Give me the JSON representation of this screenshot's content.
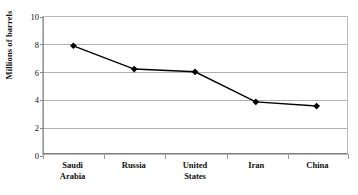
{
  "chart_data": {
    "type": "line",
    "title": "",
    "xlabel": "",
    "ylabel": "Millions of barrels",
    "categories": [
      "Saudi Arabia",
      "Russia",
      "United States",
      "Iran",
      "China"
    ],
    "category_lines": [
      [
        "Saudi",
        "Arabia"
      ],
      [
        "Russia"
      ],
      [
        "United",
        "States"
      ],
      [
        "Iran"
      ],
      [
        "China"
      ]
    ],
    "values": [
      7.9,
      6.2,
      6.0,
      3.8,
      3.5
    ],
    "ylim": [
      0,
      10
    ],
    "ytick_values": [
      0,
      2,
      4,
      6,
      8,
      10
    ],
    "ytick_labels": [
      "0",
      "2",
      "4",
      "6",
      "8",
      "10"
    ],
    "grid": true,
    "legend": false,
    "series": [
      {
        "name": "Oil production",
        "values": [
          7.9,
          6.2,
          6.0,
          3.8,
          3.5
        ],
        "line_color": "#000000",
        "marker": "diamond",
        "marker_color": "#000000"
      }
    ],
    "colors": {
      "line": "#000000",
      "marker": "#000000",
      "grid": "#b0b0b0",
      "border": "#b9b9b9",
      "text": "#111111",
      "background": "#ffffff"
    }
  }
}
